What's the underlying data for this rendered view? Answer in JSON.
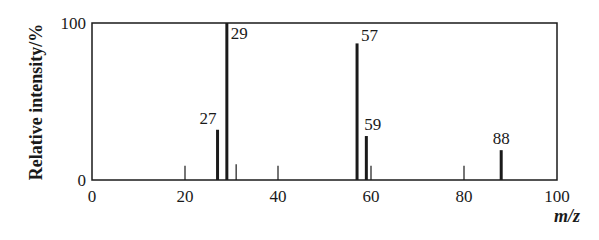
{
  "chart_data": {
    "type": "bar",
    "title": "",
    "xlabel": "m/z",
    "ylabel": "Relative intensity/%",
    "xlim": [
      0,
      100
    ],
    "ylim": [
      0,
      100
    ],
    "x_ticks": [
      0,
      20,
      40,
      60,
      80,
      100
    ],
    "y_ticks": [
      0,
      100
    ],
    "grid": false,
    "legend": null,
    "peaks": [
      {
        "mz": 20,
        "intensity": 9,
        "label": ""
      },
      {
        "mz": 27,
        "intensity": 32,
        "label": "27"
      },
      {
        "mz": 29,
        "intensity": 100,
        "label": "29"
      },
      {
        "mz": 31,
        "intensity": 10,
        "label": ""
      },
      {
        "mz": 40,
        "intensity": 9,
        "label": ""
      },
      {
        "mz": 57,
        "intensity": 87,
        "label": "57"
      },
      {
        "mz": 59,
        "intensity": 28,
        "label": "59"
      },
      {
        "mz": 60,
        "intensity": 9,
        "label": ""
      },
      {
        "mz": 80,
        "intensity": 9,
        "label": ""
      },
      {
        "mz": 88,
        "intensity": 19,
        "label": "88"
      }
    ]
  },
  "colors": {
    "line": "#1a1a1a",
    "background": "#ffffff"
  }
}
